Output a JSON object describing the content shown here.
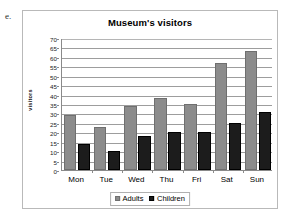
{
  "item_label": "e.",
  "legend": {
    "position": "bottom",
    "entries": [
      {
        "name": "Adults",
        "color": "#8c8c8c",
        "swatch": "adults-swatch"
      },
      {
        "name": "Children",
        "color": "#1c1c1c",
        "swatch": "children-swatch"
      }
    ]
  },
  "chart_data": {
    "type": "bar",
    "title": "Museum's visitors",
    "xlabel": "",
    "ylabel": "visitors",
    "categories": [
      "Mon",
      "Tue",
      "Wed",
      "Thu",
      "Fri",
      "Sat",
      "Sun"
    ],
    "series": [
      {
        "name": "Adults",
        "color": "#8c8c8c",
        "values": [
          29,
          23,
          34,
          38,
          35,
          57,
          63
        ]
      },
      {
        "name": "Children",
        "color": "#1c1c1c",
        "values": [
          14,
          10,
          18,
          20,
          20,
          25,
          31
        ]
      }
    ],
    "ylim": [
      0,
      70
    ],
    "ytick_step": 5,
    "yticks": [
      0,
      5,
      10,
      15,
      20,
      25,
      30,
      35,
      40,
      45,
      50,
      55,
      60,
      65,
      70
    ],
    "grid": true,
    "grid_axis": "y",
    "legend_position": "bottom"
  }
}
